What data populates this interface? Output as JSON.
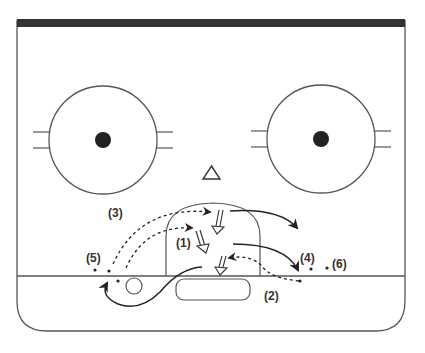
{
  "diagram": {
    "type": "hockey-rink-drill",
    "colors": {
      "line": "#555555",
      "ink": "#222222",
      "top_bar": "#333333",
      "background": "#ffffff"
    },
    "labels": [
      {
        "id": "l1",
        "text": "(1)",
        "x": 176,
        "y": 247
      },
      {
        "id": "l2",
        "text": "(2)",
        "x": 264,
        "y": 300
      },
      {
        "id": "l3",
        "text": "(3)",
        "x": 108,
        "y": 217
      },
      {
        "id": "l4",
        "text": "(4)",
        "x": 300,
        "y": 262
      },
      {
        "id": "l5",
        "text": "(5)",
        "x": 86,
        "y": 262
      },
      {
        "id": "l6",
        "text": "(6)",
        "x": 332,
        "y": 268
      }
    ],
    "players_icon": "triangle-icon",
    "faceoff_circles": [
      {
        "name": "left-faceoff-circle",
        "cx": 103,
        "cy": 140
      },
      {
        "name": "right-faceoff-circle",
        "cx": 321,
        "cy": 139
      }
    ]
  }
}
